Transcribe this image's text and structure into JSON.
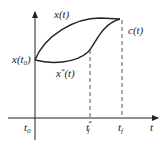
{
  "diagram": {
    "axes": {
      "x_label": "t",
      "y_label": ""
    },
    "curves": [
      {
        "name": "x(t)",
        "label": "x(t)",
        "style": "solid"
      },
      {
        "name": "x*(t)",
        "label_base": "x",
        "label_sup": "*",
        "label_arg": "(t)",
        "style": "solid"
      }
    ],
    "target_curve": {
      "label": "c(t)"
    },
    "initial_point": {
      "label_base": "x(t",
      "label_sub": "0",
      "label_end": ")"
    },
    "ticks": [
      {
        "base": "t",
        "sub": "0",
        "sup": ""
      },
      {
        "base": "t",
        "sub": "f",
        "sup": "*"
      },
      {
        "base": "t",
        "sub": "f",
        "sup": ""
      }
    ],
    "colors": {
      "line": "#222222",
      "background": "#ffffff"
    }
  }
}
